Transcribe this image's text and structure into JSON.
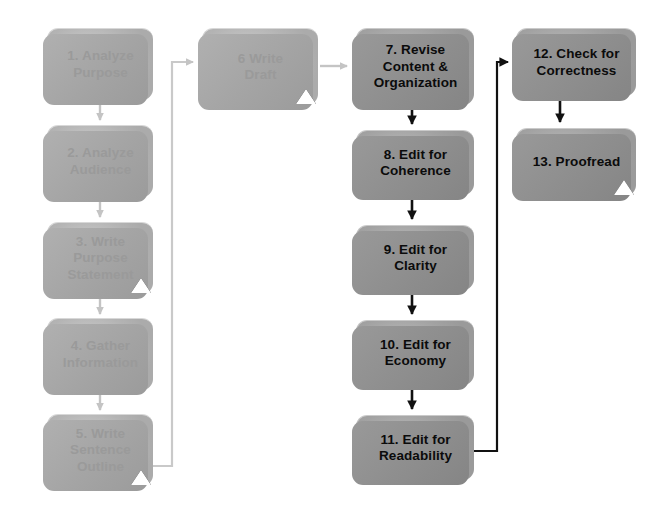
{
  "diagram": {
    "colors": {
      "pale_box_fill": "#c4c4c4",
      "pale_box_text": "#9a9a9a",
      "dark_box_fill": "#b1b1b1",
      "dark_box_text": "#0b0b0b",
      "pale_connector": "#c9c9c9",
      "dark_connector": "#111111",
      "marker_triangle": "#ffffff",
      "background": "#ffffff"
    },
    "columns": [
      {
        "name": "planning",
        "style": "pale"
      },
      {
        "name": "drafting",
        "style": "pale"
      },
      {
        "name": "revising",
        "style": "dark"
      },
      {
        "name": "editing-final",
        "style": "dark"
      }
    ],
    "nodes": [
      {
        "id": "step-1",
        "label": "1. Analyze\nPurpose",
        "style": "pale",
        "x": 47,
        "y": 28,
        "w": 106,
        "h": 72,
        "marker": false
      },
      {
        "id": "step-2",
        "label": "2. Analyze\nAudience",
        "style": "pale",
        "x": 47,
        "y": 125,
        "w": 106,
        "h": 72,
        "marker": false
      },
      {
        "id": "step-3",
        "label": "3. Write\nPurpose\nStatement",
        "style": "pale",
        "x": 47,
        "y": 222,
        "w": 106,
        "h": 72,
        "marker": true
      },
      {
        "id": "step-4",
        "label": "4. Gather\nInformation",
        "style": "pale",
        "x": 47,
        "y": 318,
        "w": 106,
        "h": 72,
        "marker": false
      },
      {
        "id": "step-5",
        "label": "5. Write\nSentence\nOutline",
        "style": "pale",
        "x": 47,
        "y": 414,
        "w": 106,
        "h": 72,
        "marker": true
      },
      {
        "id": "step-6",
        "label": "6 Write\nDraft",
        "style": "pale",
        "x": 202,
        "y": 28,
        "w": 116,
        "h": 77,
        "marker": true
      },
      {
        "id": "step-7",
        "label": "7. Revise\nContent &\nOrganization",
        "style": "dark",
        "x": 356,
        "y": 28,
        "w": 118,
        "h": 77,
        "marker": false
      },
      {
        "id": "step-8",
        "label": "8. Edit for\nCoherence",
        "style": "dark",
        "x": 356,
        "y": 130,
        "w": 118,
        "h": 65,
        "marker": false
      },
      {
        "id": "step-9",
        "label": "9. Edit for\nClarity",
        "style": "dark",
        "x": 356,
        "y": 225,
        "w": 118,
        "h": 65,
        "marker": false
      },
      {
        "id": "step-10",
        "label": "10. Edit for\nEconomy",
        "style": "dark",
        "x": 356,
        "y": 320,
        "w": 118,
        "h": 65,
        "marker": false
      },
      {
        "id": "step-11",
        "label": "11. Edit for\nReadability",
        "style": "dark",
        "x": 356,
        "y": 415,
        "w": 118,
        "h": 65,
        "marker": false
      },
      {
        "id": "step-12",
        "label": "12. Check for\nCorrectness",
        "style": "dark",
        "x": 516,
        "y": 28,
        "w": 120,
        "h": 68,
        "marker": false
      },
      {
        "id": "step-13",
        "label": "13. Proofread",
        "style": "dark",
        "x": 516,
        "y": 128,
        "w": 120,
        "h": 68,
        "marker": true
      }
    ],
    "connectors": [
      {
        "id": "conn-1-2",
        "from": "step-1",
        "to": "step-2",
        "color": "#c9c9c9",
        "kind": "vertical"
      },
      {
        "id": "conn-2-3",
        "from": "step-2",
        "to": "step-3",
        "color": "#c9c9c9",
        "kind": "vertical"
      },
      {
        "id": "conn-3-4",
        "from": "step-3",
        "to": "step-4",
        "color": "#c9c9c9",
        "kind": "vertical"
      },
      {
        "id": "conn-4-5",
        "from": "step-4",
        "to": "step-5",
        "color": "#c9c9c9",
        "kind": "vertical"
      },
      {
        "id": "conn-5-6",
        "from": "step-5",
        "to": "step-6",
        "color": "#c9c9c9",
        "kind": "elbow-up-right"
      },
      {
        "id": "conn-6-7",
        "from": "step-6",
        "to": "step-7",
        "color": "#c9c9c9",
        "kind": "horizontal"
      },
      {
        "id": "conn-7-8",
        "from": "step-7",
        "to": "step-8",
        "color": "#111111",
        "kind": "vertical"
      },
      {
        "id": "conn-8-9",
        "from": "step-8",
        "to": "step-9",
        "color": "#111111",
        "kind": "vertical"
      },
      {
        "id": "conn-9-10",
        "from": "step-9",
        "to": "step-10",
        "color": "#111111",
        "kind": "vertical"
      },
      {
        "id": "conn-10-11",
        "from": "step-10",
        "to": "step-11",
        "color": "#111111",
        "kind": "vertical"
      },
      {
        "id": "conn-11-12",
        "from": "step-11",
        "to": "step-12",
        "color": "#111111",
        "kind": "elbow-up-right"
      },
      {
        "id": "conn-12-13",
        "from": "step-12",
        "to": "step-13",
        "color": "#111111",
        "kind": "vertical"
      }
    ]
  }
}
